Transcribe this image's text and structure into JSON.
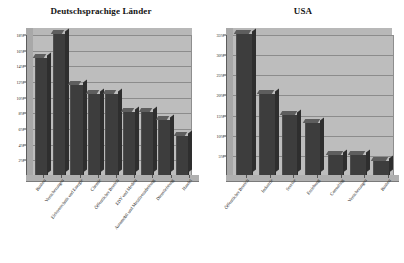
{
  "page": {
    "background": "#ffffff",
    "bar_color": "#3d3d3d",
    "plot_background": "#bdbdbd",
    "gridline_color": "#8c8c8c"
  },
  "chart_data": [
    {
      "type": "bar",
      "title": "Deutschsprachige Länder",
      "xlabel": "",
      "ylabel": "",
      "ylim": [
        0,
        18
      ],
      "grid": true,
      "legend": "none",
      "yticks": [
        "2%",
        "4%",
        "6%",
        "8%",
        "10%",
        "12%",
        "14%",
        "16%",
        "18%"
      ],
      "ytick_values": [
        2,
        4,
        6,
        8,
        10,
        12,
        14,
        16,
        18
      ],
      "categories": [
        "Banken",
        "Versicherungen",
        "Elektrotechnik und Energie",
        "Chemie",
        "Öffentlicher Bereich",
        "EDV und Medien",
        "Automobil und Metallverarbeitung",
        "Dienstleistung",
        "Handel"
      ],
      "values": [
        15.0,
        18.0,
        11.5,
        10.3,
        10.3,
        8.0,
        8.0,
        7.0,
        5.0
      ]
    },
    {
      "type": "bar",
      "title": "USA",
      "xlabel": "",
      "ylabel": "",
      "ylim": [
        0,
        35
      ],
      "grid": true,
      "legend": "none",
      "yticks": [
        "5%",
        "10%",
        "15%",
        "20%",
        "25%",
        "30%",
        "35%"
      ],
      "ytick_values": [
        5,
        10,
        15,
        20,
        25,
        30,
        35
      ],
      "categories": [
        "Öffentlicher Bereich",
        "Industrie",
        "Service",
        "Erziehung",
        "Consulting",
        "Versicherungen",
        "Banken"
      ],
      "values": [
        35.0,
        20.0,
        15.0,
        13.0,
        5.0,
        5.0,
        3.5
      ]
    }
  ]
}
